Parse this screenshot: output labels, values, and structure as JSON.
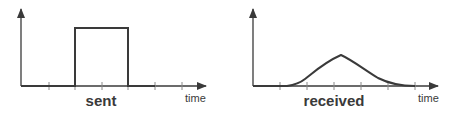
{
  "diagrams": [
    {
      "name": "sent",
      "caption": "sent",
      "x_axis_label": "time",
      "signal_type": "rectangular-pulse"
    },
    {
      "name": "received",
      "caption": "received",
      "x_axis_label": "time",
      "signal_type": "smoothed-bell-pulse"
    }
  ],
  "colors": {
    "line": "#3a3a3a",
    "tick": "#8a8a8a",
    "background": "#ffffff"
  }
}
